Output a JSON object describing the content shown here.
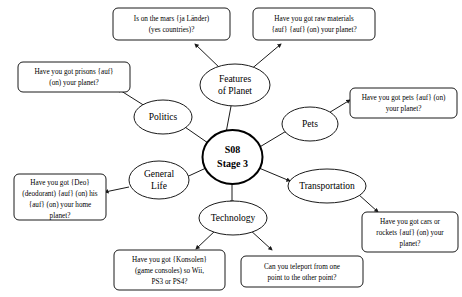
{
  "diagram": {
    "type": "mind-map",
    "background_color": "#ffffff",
    "line_color": "#1a1a1a",
    "center": {
      "label_line1": "S08",
      "label_line2": "Stage 3"
    },
    "branches": [
      {
        "id": "features-of-planet",
        "label_line1": "Features",
        "label_line2": "of Planet",
        "leaves": [
          "mars-countries",
          "raw-materials"
        ]
      },
      {
        "id": "politics",
        "label_line1": "Politics",
        "label_line2": "",
        "leaves": [
          "prisons"
        ]
      },
      {
        "id": "pets",
        "label_line1": "Pets",
        "label_line2": "",
        "leaves": [
          "pets-question"
        ]
      },
      {
        "id": "general-life",
        "label_line1": "General",
        "label_line2": "Life",
        "leaves": [
          "deodorant"
        ]
      },
      {
        "id": "transportation",
        "label_line1": "Transportation",
        "label_line2": "",
        "leaves": [
          "cars-rockets"
        ]
      },
      {
        "id": "technology",
        "label_line1": "Technology",
        "label_line2": "",
        "leaves": [
          "consoles",
          "teleport"
        ]
      }
    ],
    "leaves": {
      "mars-countries": {
        "lines": [
          "Is on the mars {ja Länder)",
          "(yes countries)?"
        ]
      },
      "raw-materials": {
        "lines": [
          "Have you got raw materials",
          "{auf} {auf} (on) your planet?"
        ]
      },
      "prisons": {
        "lines": [
          "Have you got prisons {auf}",
          "(on) your planet?"
        ]
      },
      "pets-question": {
        "lines": [
          "Have you got pets {auf} (on)",
          "your planet?"
        ]
      },
      "deodorant": {
        "lines": [
          "Have you got {Deo}",
          "(deodorant) {auf} (on) his",
          "{auf} (on) your home",
          "planet?"
        ]
      },
      "cars-rockets": {
        "lines": [
          "Have you got cars or",
          "rockets {auf} (on) your",
          "planet?"
        ]
      },
      "consoles": {
        "lines": [
          "Have you got {Konsolen}",
          "(game consoles) so Wii,",
          "PS3 or PS4?"
        ]
      },
      "teleport": {
        "lines": [
          "Can you teleport from one",
          "point to the other point?"
        ]
      }
    }
  }
}
